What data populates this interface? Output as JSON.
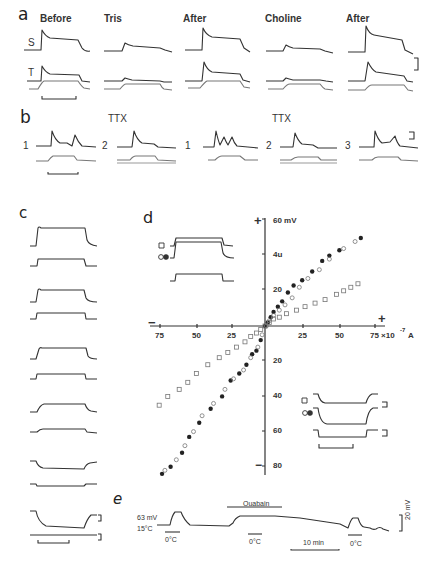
{
  "figure": {
    "panels": {
      "a": {
        "letter": "a",
        "columns": [
          "Before",
          "Tris",
          "After",
          "Choline",
          "After"
        ],
        "row_labels": [
          "S",
          "T"
        ]
      },
      "b": {
        "letter": "b",
        "headers": [
          "TTX",
          "TTX"
        ],
        "trace_numbers": [
          "1",
          "2",
          "1",
          "2",
          "3"
        ]
      },
      "c": {
        "letter": "c"
      },
      "d": {
        "letter": "d",
        "y_top_label": "60 mV",
        "y_up_ticks": [
          "4u",
          "20"
        ],
        "y_down_ticks": [
          "20",
          "40",
          "60",
          "80"
        ],
        "x_left_ticks": [
          "75",
          "50",
          "25"
        ],
        "x_right_ticks": [
          "25",
          "50",
          "75 ×10"
        ],
        "x_unit_exp": "-7",
        "x_unit": "A",
        "plus_sign": "+",
        "minus_sign": "−"
      },
      "e": {
        "letter": "e",
        "start_label_1": "63 mV",
        "start_label_2": "15°C",
        "drug_label": "Ouabain",
        "cold_labels": [
          "0°C",
          "0°C",
          "0°C"
        ],
        "time_scale": "10 min",
        "voltage_scale": "20 mV"
      }
    }
  },
  "chart_data": {
    "type": "scatter",
    "title": "d",
    "xlabel": "Current (×10^-7 A)",
    "ylabel": "Membrane potential (mV)",
    "xlim": [
      -80,
      80
    ],
    "ylim": [
      -85,
      60
    ],
    "x_tick_labels": [
      "75",
      "50",
      "25",
      "25",
      "50",
      "75 ×10^-7 A"
    ],
    "y_tick_labels": [
      "60 mV",
      "40",
      "20",
      "20",
      "40",
      "60",
      "80"
    ],
    "grid": false,
    "legend": [
      "□ open squares",
      "○ open circles",
      "● filled circles"
    ],
    "series": [
      {
        "name": "filled circles",
        "x": [
          -72,
          -66,
          -58,
          -53,
          -46,
          -38,
          -30,
          -24,
          -18,
          -13,
          -9,
          -6,
          -3,
          0,
          2,
          4,
          6,
          9,
          12,
          16,
          20,
          26,
          33,
          40,
          45,
          52,
          67
        ],
        "y": [
          -84,
          -80,
          -72,
          -63,
          -55,
          -47,
          -40,
          -31,
          -27,
          -22,
          -16,
          -14,
          -8,
          0,
          2,
          5,
          8,
          11,
          14,
          19,
          23,
          26,
          31,
          37,
          40,
          43,
          50
        ]
      },
      {
        "name": "open circles",
        "x": [
          -70,
          -62,
          -56,
          -50,
          -44,
          -36,
          -28,
          -22,
          -15,
          -10,
          -5,
          -2,
          1,
          3,
          6,
          10,
          14,
          19,
          24,
          30,
          38,
          45,
          55,
          63
        ],
        "y": [
          -82,
          -76,
          -68,
          -60,
          -51,
          -44,
          -36,
          -30,
          -25,
          -18,
          -12,
          -5,
          0,
          3,
          6,
          9,
          12,
          16,
          22,
          27,
          32,
          38,
          44,
          48
        ]
      },
      {
        "name": "open squares",
        "x": [
          -74,
          -68,
          -60,
          -54,
          -48,
          -40,
          -32,
          -26,
          -20,
          -14,
          -10,
          -6,
          -3,
          0,
          3,
          6,
          10,
          15,
          22,
          28,
          35,
          42,
          50,
          55,
          60,
          65
        ],
        "y": [
          -45,
          -40,
          -36,
          -32,
          -27,
          -22,
          -18,
          -15,
          -12,
          -9,
          -6,
          -4,
          -2,
          0,
          2,
          4,
          5,
          7,
          9,
          11,
          13,
          15,
          18,
          20,
          22,
          24
        ]
      }
    ]
  }
}
